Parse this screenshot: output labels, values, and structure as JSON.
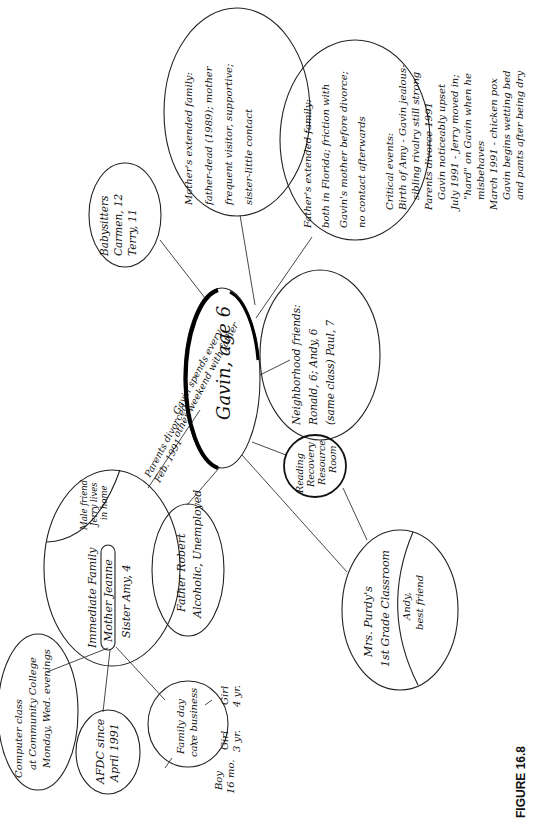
{
  "figure": {
    "label": "FIGURE 16.8",
    "type": "ecomap"
  },
  "center_node": {
    "label": "Gavin, age 6"
  },
  "nodes": {
    "babysitters": {
      "lines": [
        "Babysitters",
        "Carmen, 12",
        "Terry, 11"
      ]
    },
    "mothers_extended_family": {
      "lines": [
        "Mother's extended family:",
        "father-dead (1989); mother",
        "frequent visitor, supportive;",
        "sister-little contact"
      ]
    },
    "fathers_extended_family": {
      "lines": [
        "Father's extended family:",
        "both in Florida; friction with",
        "Gavin's mother before divorce;",
        "no contact afterwards"
      ]
    },
    "neighborhood_friends": {
      "lines": [
        "Neighborhood friends:",
        "Ronald, 6; Andy, 6",
        "(same class) Paul, 7"
      ]
    },
    "reading_recovery": {
      "lines": [
        "Reading",
        "Recovery",
        "Resource",
        "Room"
      ]
    },
    "classroom": {
      "lines": [
        "Mrs. Purdy's",
        "1st Grade Classroom"
      ],
      "sub_region": {
        "lines": [
          "Andy,",
          "best friend"
        ]
      }
    },
    "father": {
      "lines": [
        "Father Robert",
        "Alcoholic, Unemployed"
      ]
    },
    "immediate_family": {
      "title": "Immediate Family",
      "mother": "Mother Jeanne",
      "sister": "Sister Amy, 4",
      "sub_region": {
        "lines": [
          "Male friend",
          "Jerry lives",
          "in home"
        ]
      }
    },
    "computer_class": {
      "lines": [
        "Computer class",
        "at Community College",
        "Monday, Wed. evenings"
      ]
    },
    "afdc": {
      "lines": [
        "AFDC since",
        "April 1991"
      ]
    },
    "day_care": {
      "lines": [
        "Family day",
        "care business"
      ],
      "children": [
        {
          "lines": [
            "Boy",
            "16 mo."
          ]
        },
        {
          "lines": [
            "Girl",
            "3 yr."
          ]
        },
        {
          "lines": [
            "Girl",
            "4 yr."
          ]
        }
      ]
    }
  },
  "annotations": {
    "divorce_note": {
      "lines": [
        "Parents divorced",
        "Feb. 1991",
        "Gavin spends every",
        "other weekend with father"
      ]
    },
    "critical_events": {
      "lines": [
        "Critical events:",
        "Birth of Amy - Gavin jealous-",
        "sibling rivalry still strong",
        "Parents divorce 1991",
        "Gavin noticeably upset",
        "July 1991 - Jerry moved in;",
        "\"hard\" on Gavin when he",
        "misbehaves",
        "March 1991 - chicken pox",
        "Gavin begins wetting bed",
        "and pants after being dry"
      ]
    }
  }
}
